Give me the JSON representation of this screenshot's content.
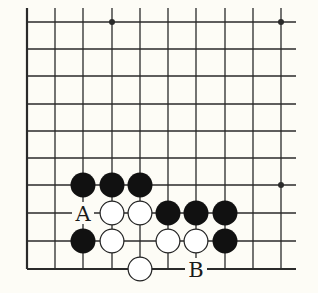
{
  "diagram": {
    "type": "go-board-fragment",
    "visible_columns": 10,
    "visible_rows": 10,
    "edges": [
      "left",
      "bottom"
    ],
    "colors": {
      "background": "#fdfcf6",
      "line": "#2a2a2a",
      "black_stone": "#111111",
      "white_stone_fill": "#ffffff",
      "white_stone_stroke": "#222222"
    },
    "star_points": [
      {
        "col": 3,
        "row": 0
      },
      {
        "col": 9,
        "row": 0
      },
      {
        "col": 9,
        "row": 6
      }
    ],
    "stones": [
      {
        "color": "black",
        "col": 2,
        "row": 6
      },
      {
        "color": "black",
        "col": 3,
        "row": 6
      },
      {
        "color": "black",
        "col": 4,
        "row": 6
      },
      {
        "color": "white",
        "col": 3,
        "row": 7
      },
      {
        "color": "white",
        "col": 4,
        "row": 7
      },
      {
        "color": "black",
        "col": 5,
        "row": 7
      },
      {
        "color": "black",
        "col": 6,
        "row": 7
      },
      {
        "color": "black",
        "col": 7,
        "row": 7
      },
      {
        "color": "black",
        "col": 2,
        "row": 8
      },
      {
        "color": "white",
        "col": 3,
        "row": 8
      },
      {
        "color": "white",
        "col": 5,
        "row": 8
      },
      {
        "color": "white",
        "col": 6,
        "row": 8
      },
      {
        "color": "black",
        "col": 7,
        "row": 8
      },
      {
        "color": "white",
        "col": 4,
        "row": 9
      }
    ],
    "labels": [
      {
        "text": "A",
        "col": 2,
        "row": 7
      },
      {
        "text": "B",
        "col": 6,
        "row": 9
      }
    ]
  }
}
